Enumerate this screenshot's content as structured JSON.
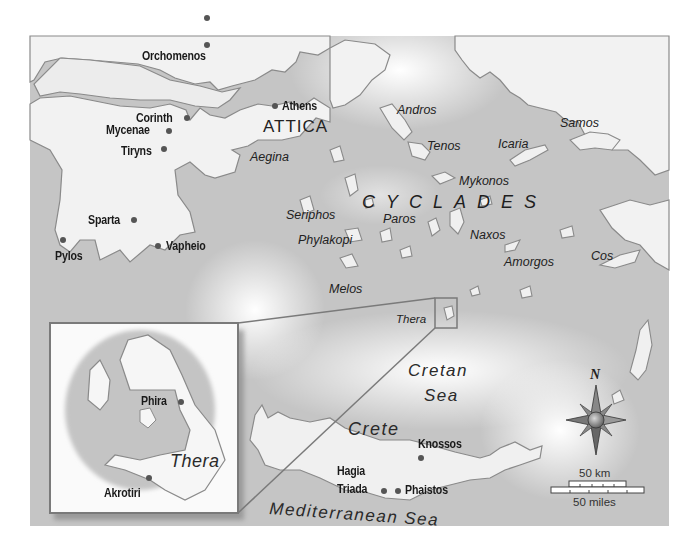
{
  "map": {
    "title": "Aegean Bronze Age sites",
    "sites": [
      {
        "name": "Orchomenos"
      },
      {
        "name": "Athens"
      },
      {
        "name": "Corinth"
      },
      {
        "name": "Mycenae"
      },
      {
        "name": "Tiryns"
      },
      {
        "name": "Sparta"
      },
      {
        "name": "Vapheio"
      },
      {
        "name": "Pylos"
      },
      {
        "name": "Knossos"
      },
      {
        "name": "Hagia"
      },
      {
        "name": "Triada"
      },
      {
        "name": "Phaistos"
      }
    ],
    "regions": {
      "attica": "ATTICA",
      "cyclades": "CYCLADES",
      "crete": "Crete"
    },
    "islands": [
      {
        "name": "Aegina"
      },
      {
        "name": "Andros"
      },
      {
        "name": "Tenos"
      },
      {
        "name": "Icaria"
      },
      {
        "name": "Samos"
      },
      {
        "name": "Mykonos"
      },
      {
        "name": "Seriphos"
      },
      {
        "name": "Paros"
      },
      {
        "name": "Naxos"
      },
      {
        "name": "Phylakopi"
      },
      {
        "name": "Amorgos"
      },
      {
        "name": "Cos"
      },
      {
        "name": "Melos"
      },
      {
        "name": "Thera"
      }
    ],
    "seas": {
      "cretan_line1": "Cretan",
      "cretan_line2": "Sea",
      "mediterranean": "Mediterranean Sea"
    },
    "inset": {
      "island": "Thera",
      "sites": [
        {
          "name": "Phira"
        },
        {
          "name": "Akrotiri"
        }
      ]
    },
    "compass": {
      "north_label": "N"
    },
    "scale": {
      "km_label": "50 km",
      "miles_label": "50 miles"
    },
    "colors": {
      "sea": "#c4c4c4",
      "land": "#f2f2f2",
      "coast": "#8a8a8a",
      "inset_border": "#7a7a7a",
      "dot": "#555555"
    }
  }
}
